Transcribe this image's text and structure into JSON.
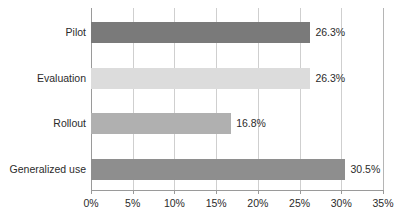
{
  "chart_data": {
    "type": "bar",
    "orientation": "horizontal",
    "title": "",
    "subtitle": "",
    "xlabel": "",
    "ylabel": "",
    "categories": [
      "Pilot",
      "Evaluation",
      "Rollout",
      "Generalized use"
    ],
    "values": [
      26.3,
      26.3,
      16.8,
      30.5
    ],
    "data_labels": [
      "26.3%",
      "26.3%",
      "16.8%",
      "30.5%"
    ],
    "bar_colors": [
      "#7a7a7a",
      "#dcdcdc",
      "#b0b0b0",
      "#8e8e8e"
    ],
    "xlim": [
      0,
      35
    ],
    "xticks": [
      0,
      5,
      10,
      15,
      20,
      25,
      30,
      35
    ],
    "xtick_labels": [
      "0%",
      "5%",
      "10%",
      "15%",
      "20%",
      "25%",
      "30%",
      "35%"
    ],
    "grid": "vertical",
    "gridline_color": "#cfcfcf",
    "axis_color": "#9a9a9a",
    "legend": "none",
    "background": "#ffffff",
    "text_color": "#2b2b2b"
  }
}
